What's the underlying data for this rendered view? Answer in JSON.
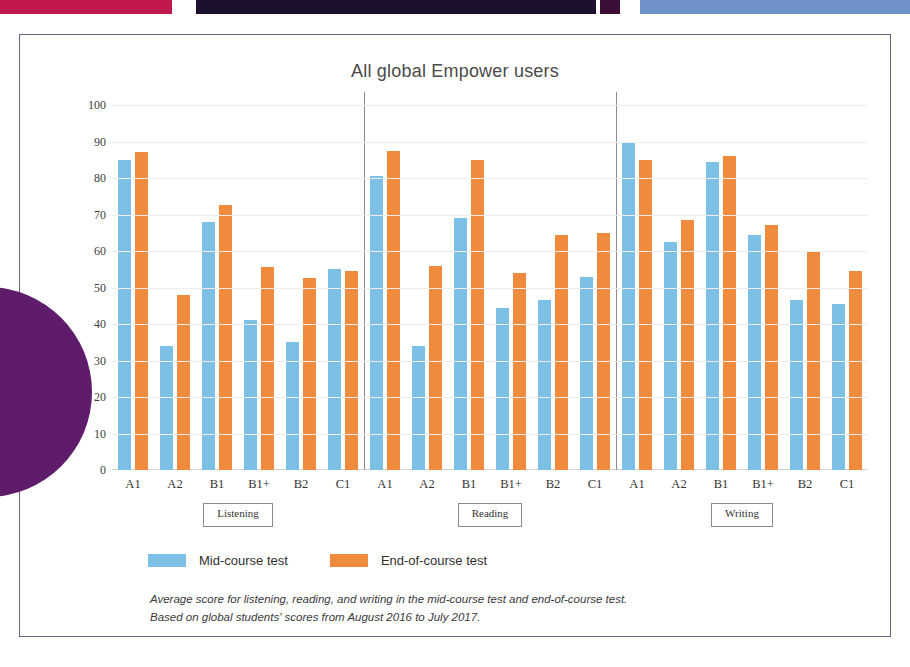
{
  "decor": {
    "top_bars": [
      {
        "name": "crimson",
        "color": "#c2194c"
      },
      {
        "name": "navy",
        "color": "#1d0f2e"
      },
      {
        "name": "plum",
        "color": "#3c0d36"
      },
      {
        "name": "blue",
        "color": "#6f93c9"
      }
    ],
    "circle_color": "#5e1c6b",
    "card_border_color": "#6c5f86"
  },
  "legend": {
    "items": [
      {
        "label": "Mid-course test",
        "color": "#7dc0e5"
      },
      {
        "label": "End-of-course test",
        "color": "#f08a3c"
      }
    ]
  },
  "caption": {
    "line1": "Average score for listening, reading, and writing in the mid-course test and end-of-course test.",
    "line2": "Based on global students' scores from August 2016 to July 2017."
  },
  "chart_data": {
    "type": "bar",
    "title": "All global Empower users",
    "xlabel": "",
    "ylabel": "",
    "ylim": [
      0,
      100
    ],
    "yticks": [
      0,
      10,
      20,
      30,
      40,
      50,
      60,
      70,
      80,
      90,
      100
    ],
    "ytick_labels": [
      "0",
      "10",
      "20",
      "30",
      "40",
      "50",
      "60",
      "70",
      "80",
      "90",
      "100"
    ],
    "grid": true,
    "legend_position": "bottom-left",
    "categories": [
      "A1",
      "A2",
      "B1",
      "B1+",
      "B2",
      "C1"
    ],
    "groups": [
      "Listening",
      "Reading",
      "Writing"
    ],
    "series": [
      {
        "name": "Mid-course test",
        "color": "#7dc0e5"
      },
      {
        "name": "End-of-course test",
        "color": "#f08a3c"
      }
    ],
    "panels": [
      {
        "group": "Listening",
        "categories": [
          "A1",
          "A2",
          "B1",
          "B1+",
          "B2",
          "C1"
        ],
        "series": [
          {
            "name": "Mid-course test",
            "values": [
              85,
              34,
              68,
              41,
              35,
              55
            ]
          },
          {
            "name": "End-of-course test",
            "values": [
              87,
              48,
              72.5,
              55.5,
              52.5,
              54.5
            ]
          }
        ]
      },
      {
        "group": "Reading",
        "categories": [
          "A1",
          "A2",
          "B1",
          "B1+",
          "B2",
          "C1"
        ],
        "series": [
          {
            "name": "Mid-course test",
            "values": [
              80.5,
              34,
              69,
              44.5,
              46.5,
              53
            ]
          },
          {
            "name": "End-of-course test",
            "values": [
              87.5,
              56,
              85,
              54,
              64.5,
              65
            ]
          }
        ]
      },
      {
        "group": "Writing",
        "categories": [
          "A1",
          "A2",
          "B1",
          "B1+",
          "B2",
          "C1"
        ],
        "series": [
          {
            "name": "Mid-course test",
            "values": [
              90,
              62.5,
              84.5,
              64.5,
              46.5,
              45.5
            ]
          },
          {
            "name": "End-of-course test",
            "values": [
              85,
              68.5,
              86,
              67,
              60,
              54.5
            ]
          }
        ]
      }
    ]
  }
}
